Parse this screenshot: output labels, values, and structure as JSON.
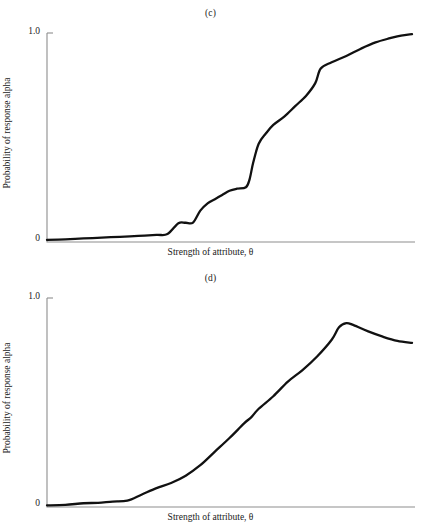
{
  "figure": {
    "background": "#ffffff",
    "line_color": "#111111",
    "axis_color": "#8e8e8e",
    "width": 421,
    "height": 531
  },
  "panels": [
    {
      "id": "c",
      "label": "(c)",
      "ylabel": "Probability of response alpha",
      "xlabel": "Strength of attribute, θ",
      "yticks": [
        "1.0",
        "0"
      ]
    },
    {
      "id": "d",
      "label": "(d)",
      "ylabel": "Probability of response alpha",
      "xlabel": "Strength of attribute, θ",
      "yticks": [
        "1.0",
        "0"
      ]
    }
  ],
  "footer": {
    "smudge": "—  ——  ———   ——  ————  ——   ———  ——  ————   ——  ———  ——"
  },
  "chart_data": [
    {
      "type": "line",
      "title": "(c)",
      "xlabel": "Strength of attribute, θ",
      "ylabel": "Probability of response alpha",
      "xlim": [
        0,
        1
      ],
      "ylim": [
        0,
        1
      ],
      "grid": false,
      "legend": null,
      "yticks": [
        0,
        1.0
      ],
      "ytick_labels": [
        "0",
        "1.0"
      ],
      "description": "Monotone increasing staircase-like ogive with plateaus; rises from ~0.01 to ~0.99",
      "x": [
        0.0,
        0.05,
        0.1,
        0.15,
        0.2,
        0.25,
        0.3,
        0.33,
        0.36,
        0.38,
        0.4,
        0.42,
        0.44,
        0.46,
        0.48,
        0.5,
        0.52,
        0.545,
        0.555,
        0.565,
        0.58,
        0.6,
        0.62,
        0.65,
        0.68,
        0.71,
        0.735,
        0.75,
        0.78,
        0.82,
        0.86,
        0.9,
        0.94,
        0.97,
        1.0
      ],
      "y": [
        0.01,
        0.013,
        0.017,
        0.021,
        0.025,
        0.029,
        0.034,
        0.038,
        0.09,
        0.092,
        0.093,
        0.15,
        0.185,
        0.205,
        0.225,
        0.245,
        0.255,
        0.262,
        0.3,
        0.38,
        0.47,
        0.52,
        0.56,
        0.6,
        0.65,
        0.7,
        0.76,
        0.83,
        0.86,
        0.89,
        0.925,
        0.955,
        0.975,
        0.988,
        0.995
      ]
    },
    {
      "type": "line",
      "title": "(d)",
      "xlabel": "Strength of attribute, θ",
      "ylabel": "Probability of response alpha",
      "xlim": [
        0,
        1
      ],
      "ylim": [
        0,
        1
      ],
      "grid": false,
      "legend": null,
      "yticks": [
        0,
        1.0
      ],
      "ytick_labels": [
        "0",
        "1.0"
      ],
      "description": "Single-peaked (unimodal) curve rising to ~0.88 near θ=0.82 then declining to ~0.78",
      "x": [
        0.0,
        0.05,
        0.1,
        0.14,
        0.18,
        0.22,
        0.26,
        0.3,
        0.34,
        0.38,
        0.42,
        0.46,
        0.5,
        0.54,
        0.56,
        0.58,
        0.62,
        0.66,
        0.7,
        0.74,
        0.78,
        0.8,
        0.82,
        0.84,
        0.88,
        0.92,
        0.96,
        1.0
      ],
      "y": [
        0.008,
        0.01,
        0.018,
        0.02,
        0.026,
        0.03,
        0.06,
        0.09,
        0.115,
        0.15,
        0.2,
        0.265,
        0.33,
        0.4,
        0.43,
        0.47,
        0.53,
        0.6,
        0.655,
        0.72,
        0.8,
        0.86,
        0.88,
        0.87,
        0.84,
        0.815,
        0.795,
        0.785
      ]
    }
  ]
}
